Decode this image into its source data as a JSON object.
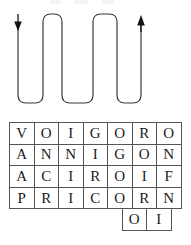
{
  "figure": {
    "title": "",
    "background_color": "#ffffff",
    "line_color": "#3a3a3c",
    "grid_border_color": "#555558",
    "text_color": "#1b1b1d"
  },
  "path_diagram": {
    "name": "serpentine-reading-path",
    "description": "boustrophedon snake path with rounded U-turns",
    "start_marker": {
      "icon": "arrow-down-icon",
      "direction": "down",
      "x": 18,
      "y": 16
    },
    "end_marker": {
      "icon": "arrow-up-icon",
      "direction": "up",
      "x": 141,
      "y": 16
    },
    "column_x": [
      18,
      43,
      62,
      93,
      117,
      141
    ],
    "top_y": 14,
    "bottom_y": 103,
    "corner_radius": 8,
    "stroke_width": 1.2,
    "turn_count": 5,
    "path_svg": "M 18 24 L 18 95 Q 18 103 26 103 L 35 103 Q 43 103 43 95 L 43 22 Q 43 14 51 14 L 54 14 Q 62 14 62 22 L 62 95 Q 62 103 70 103 L 85 103 Q 93 103 93 95 L 93 22 Q 93 14 101 14 L 109 14 Q 117 14 117 22 L 117 95 Q 117 103 125 103 L 133 103 Q 141 103 141 95 L 141 26"
  },
  "grid": {
    "name": "letter-grid",
    "columns": 7,
    "rows": 5,
    "cell_width": 24,
    "cell_height": 21,
    "rows_data": [
      {
        "cells": [
          "V",
          "O",
          "I",
          "G",
          "O",
          "R",
          "O"
        ],
        "offset": 0
      },
      {
        "cells": [
          "A",
          "N",
          "N",
          "I",
          "G",
          "O",
          "N"
        ],
        "offset": 0
      },
      {
        "cells": [
          "A",
          "C",
          "I",
          "R",
          "O",
          "I",
          "F"
        ],
        "offset": 0
      },
      {
        "cells": [
          "P",
          "R",
          "I",
          "C",
          "O",
          "R",
          "N"
        ],
        "offset": 0
      },
      {
        "cells": [
          "",
          "",
          "",
          "",
          "",
          "O",
          "I"
        ],
        "offset": 5
      }
    ]
  }
}
